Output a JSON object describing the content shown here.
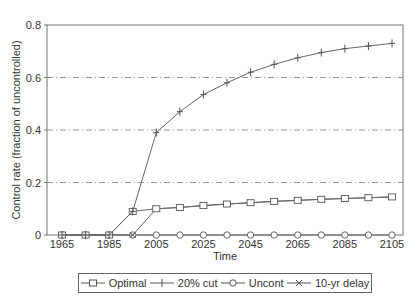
{
  "chart_data": {
    "type": "line",
    "title": "",
    "xlabel": "Time",
    "ylabel": "Control rate (fraction of uncontrolled)",
    "x": [
      1965,
      1975,
      1985,
      1995,
      2005,
      2015,
      2025,
      2035,
      2045,
      2055,
      2065,
      2075,
      2085,
      2095,
      2105
    ],
    "x_tick_labels": [
      "1965",
      "1985",
      "2005",
      "2025",
      "2045",
      "2065",
      "2085",
      "2105"
    ],
    "y_tick_labels": [
      "0",
      "0.2",
      "0.4",
      "0.6",
      "0.8"
    ],
    "ylim": [
      0,
      0.8
    ],
    "xlim": [
      1958,
      2112
    ],
    "grid": "horizontal dashed at 0.2, 0.4, 0.6",
    "legend_position": "bottom",
    "series": [
      {
        "name": "Optimal",
        "marker": "square",
        "values": [
          0,
          0,
          0,
          0.09,
          0.1,
          0.105,
          0.112,
          0.118,
          0.123,
          0.128,
          0.132,
          0.136,
          0.139,
          0.142,
          0.145
        ]
      },
      {
        "name": "20% cut",
        "marker": "plus",
        "values": [
          0,
          0,
          0,
          0.09,
          0.39,
          0.47,
          0.535,
          0.58,
          0.62,
          0.65,
          0.675,
          0.695,
          0.71,
          0.72,
          0.73
        ]
      },
      {
        "name": "Uncont",
        "marker": "circle",
        "values": [
          0,
          0,
          0,
          0,
          0,
          0,
          0,
          0,
          0,
          0,
          0,
          0,
          0,
          0,
          0
        ]
      },
      {
        "name": "10-yr delay",
        "marker": "x",
        "values": [
          0,
          0,
          0,
          0,
          0.1,
          0.105,
          0.112,
          0.118,
          0.123,
          0.128,
          0.132,
          0.136,
          0.139,
          0.142,
          0.145
        ]
      }
    ]
  },
  "legend": {
    "items": [
      "Optimal",
      "20% cut",
      "Uncont",
      "10-yr delay"
    ]
  }
}
